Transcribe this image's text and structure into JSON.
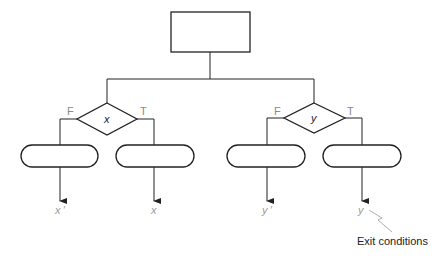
{
  "diagram": {
    "top_box": {
      "label": ""
    },
    "decisions": [
      {
        "variable": "x",
        "false_label": "F",
        "true_label": "T"
      },
      {
        "variable": "y",
        "false_label": "F",
        "true_label": "T"
      }
    ],
    "process_pills": [
      {
        "label": ""
      },
      {
        "label": ""
      },
      {
        "label": ""
      },
      {
        "label": ""
      }
    ],
    "exit_labels": [
      "x ′",
      "x",
      "y ′",
      "y"
    ],
    "annotation": "Exit conditions"
  },
  "colors": {
    "stroke": "#222222",
    "label_gray": "#8a8a8a"
  }
}
